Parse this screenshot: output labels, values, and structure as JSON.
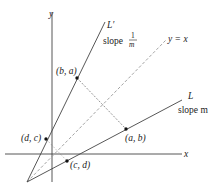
{
  "diagram": {
    "axes": {
      "x_label": "x",
      "y_label": "y"
    },
    "lines": {
      "L_prime": {
        "name": "L′",
        "slope_label_prefix": "slope",
        "slope_num": "1",
        "slope_den": "m"
      },
      "L": {
        "name": "L",
        "slope_label": "slope m"
      },
      "diagonal": {
        "label": "y = x"
      }
    },
    "points": {
      "ba": "(b, a)",
      "ab": "(a, b)",
      "dc": "(d, c)",
      "cd": "(c, d)"
    },
    "colors": {
      "line": "#333333",
      "dashed": "#888888",
      "point": "#111111"
    }
  }
}
